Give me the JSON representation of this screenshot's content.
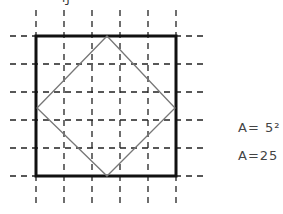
{
  "figure": {
    "grid": {
      "lines": [
        36,
        64,
        92,
        120,
        148,
        176
      ],
      "extent": [
        10,
        205
      ],
      "style": "dashed",
      "color": "#222222"
    },
    "outer_square": {
      "x": 36,
      "y": 36,
      "size": 140,
      "stroke": "#111111",
      "stroke_width": 3
    },
    "inner_square": {
      "points": [
        [
          107,
          36
        ],
        [
          175,
          108
        ],
        [
          107,
          176
        ],
        [
          37,
          108
        ]
      ],
      "stroke": "#777777"
    },
    "top_fragment": "ŋ"
  },
  "annotations": {
    "line1": "A= 5²",
    "line2": "A=25"
  }
}
